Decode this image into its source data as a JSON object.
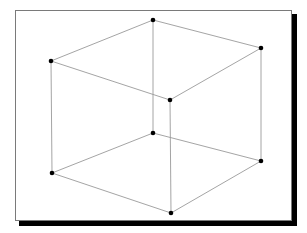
{
  "figure": {
    "type": "wireframe-cube",
    "frame": {
      "x": 15,
      "y": 10,
      "width": 277,
      "height": 211,
      "border_color": "#7a7a7a",
      "shadow_color": "#000000"
    },
    "colors": {
      "edge": "#9a9a9a",
      "vertex": "#000000",
      "background": "#ffffff"
    },
    "vertex_radius": 2.3,
    "vertices": [
      {
        "id": "back-top",
        "x": 153,
        "y": 20
      },
      {
        "id": "left-top",
        "x": 51,
        "y": 61
      },
      {
        "id": "right-top",
        "x": 261,
        "y": 48
      },
      {
        "id": "front-top",
        "x": 170,
        "y": 100
      },
      {
        "id": "back-bottom",
        "x": 153,
        "y": 133
      },
      {
        "id": "left-bottom",
        "x": 52,
        "y": 173
      },
      {
        "id": "right-bottom",
        "x": 261,
        "y": 161
      },
      {
        "id": "front-bottom",
        "x": 171,
        "y": 213
      }
    ],
    "edges": [
      [
        "back-top",
        "left-top"
      ],
      [
        "back-top",
        "right-top"
      ],
      [
        "left-top",
        "front-top"
      ],
      [
        "right-top",
        "front-top"
      ],
      [
        "back-bottom",
        "left-bottom"
      ],
      [
        "back-bottom",
        "right-bottom"
      ],
      [
        "left-bottom",
        "front-bottom"
      ],
      [
        "right-bottom",
        "front-bottom"
      ],
      [
        "back-top",
        "back-bottom"
      ],
      [
        "left-top",
        "left-bottom"
      ],
      [
        "right-top",
        "right-bottom"
      ],
      [
        "front-top",
        "front-bottom"
      ]
    ]
  }
}
